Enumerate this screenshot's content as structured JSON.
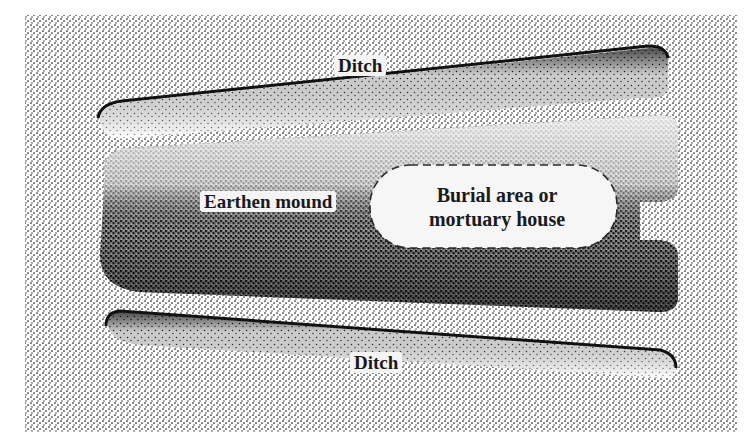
{
  "diagram": {
    "type": "stippled cross-section illustration",
    "colors": {
      "background": "#ffffff",
      "stipple": "#1a1a1a",
      "burial_area_fill": "#f6f6f6",
      "dashed_outline": "#2a2a2a"
    },
    "labels": {
      "ditch_top": "Ditch",
      "mound": "Earthen mound",
      "burial_line1": "Burial area or",
      "burial_line2": "mortuary house",
      "ditch_bottom": "Ditch"
    }
  }
}
